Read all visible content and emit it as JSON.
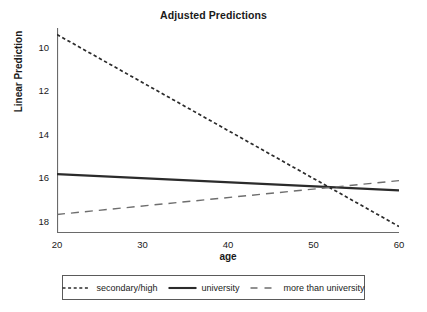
{
  "chart_data": {
    "type": "line",
    "title": "Adjusted Predictions",
    "xlabel": "age",
    "ylabel": "Linear Prediction",
    "xlim": [
      20,
      60
    ],
    "ylim": [
      9.5,
      18.9
    ],
    "xticks": [
      "20",
      "30",
      "40",
      "50",
      "60"
    ],
    "xtick_values": [
      20,
      30,
      40,
      50,
      60
    ],
    "yticks": [
      "10",
      "12",
      "14",
      "16",
      "18"
    ],
    "ytick_values": [
      10,
      12,
      14,
      16,
      18
    ],
    "grid": false,
    "legend_position": "below",
    "x": [
      20,
      60
    ],
    "series": [
      {
        "name": "secondary/high",
        "style": "dotted",
        "color": "#2b2b2b",
        "values": [
          18.6,
          9.8
        ]
      },
      {
        "name": "university",
        "style": "solid",
        "color": "#2b2b2b",
        "values": [
          12.2,
          11.45
        ]
      },
      {
        "name": "more than university",
        "style": "dashed",
        "color": "#6e6e6e",
        "values": [
          10.35,
          11.9
        ]
      }
    ]
  },
  "title": {
    "text": "Adjusted Predictions"
  },
  "axes": {
    "x_label": "age",
    "y_label": "Linear Prediction",
    "x_ticks": [
      {
        "label": "20"
      },
      {
        "label": "30"
      },
      {
        "label": "40"
      },
      {
        "label": "50"
      },
      {
        "label": "60"
      }
    ],
    "y_ticks": [
      {
        "label": "18"
      },
      {
        "label": "16"
      },
      {
        "label": "14"
      },
      {
        "label": "12"
      },
      {
        "label": "10"
      }
    ]
  },
  "legend": {
    "entries": [
      {
        "label": "secondary/high"
      },
      {
        "label": "university"
      },
      {
        "label": "more than university"
      }
    ]
  }
}
